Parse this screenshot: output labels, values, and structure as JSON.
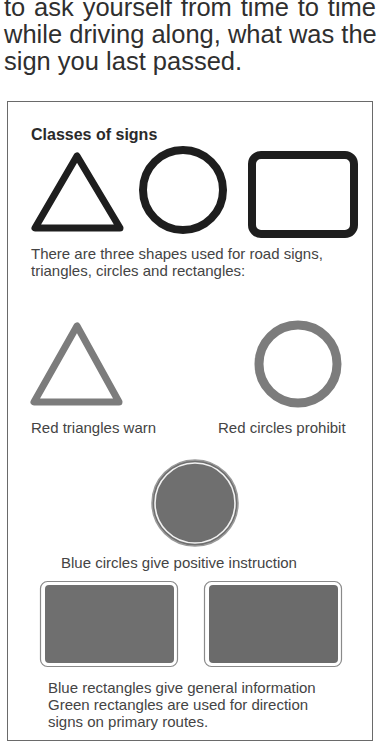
{
  "intro": {
    "lines": [
      "to ask yourself from time to time",
      "while driving along, what was the",
      "sign you last passed."
    ]
  },
  "panel": {
    "heading": "Classes of signs",
    "shapes_caption": [
      "There are three shapes used for road signs,",
      "triangles, circles and rectangles:"
    ],
    "red_triangle_caption": "Red triangles warn",
    "red_circle_caption": "Red circles prohibit",
    "blue_circle_caption": "Blue circles give positive instruction",
    "rectangles_caption": [
      "Blue rectangles give general information",
      "Green rectangles are used for direction",
      "signs on primary routes."
    ]
  },
  "colors": {
    "outline_black": "#1e1e1e",
    "red_sign_gray": "#7c7c7c",
    "blue_fill_gray": "#6f6f6f",
    "green_fill_gray": "#6b6b6b",
    "text": "#2f2f2f"
  }
}
